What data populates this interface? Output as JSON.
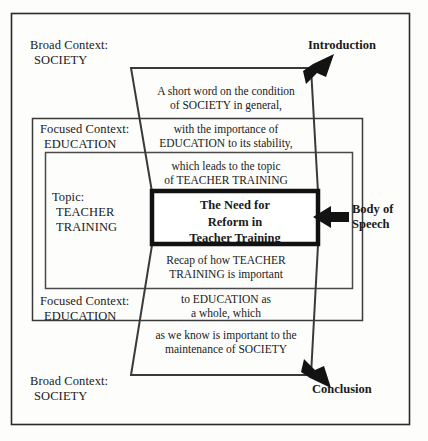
{
  "diagram": {
    "colors": {
      "ink": "#1a1a1a",
      "frame": "#222222",
      "paper": "#fdfdfc",
      "arrow_fill": "#111111"
    },
    "outer_frame": {
      "name": "outer-border"
    },
    "context_layers": [
      {
        "id": "broad-top",
        "line1": "Broad Context:",
        "line2": "SOCIETY"
      },
      {
        "id": "focused-top",
        "line1": "Focused Context:",
        "line2": "EDUCATION"
      },
      {
        "id": "topic",
        "line1": "Topic:",
        "line2": "TEACHER",
        "line3": "TRAINING"
      },
      {
        "id": "focused-bottom",
        "line1": "Focused Context:",
        "line2": "EDUCATION"
      },
      {
        "id": "broad-bottom",
        "line1": "Broad Context:",
        "line2": "SOCIETY"
      }
    ],
    "funnel_segments": [
      {
        "id": "segment-1",
        "line1": "A short word on the condition",
        "line2": "of SOCIETY in general,"
      },
      {
        "id": "segment-2",
        "line1": "with the importance of",
        "line2": "EDUCATION to its stability,"
      },
      {
        "id": "segment-3",
        "line1": "which leads to the topic",
        "line2": "of TEACHER TRAINING"
      },
      {
        "id": "segment-4",
        "line1": "Recap of how TEACHER",
        "line2": "TRAINING is important"
      },
      {
        "id": "segment-5",
        "line1": "to EDUCATION as",
        "line2": "a whole, which"
      },
      {
        "id": "segment-6",
        "line1": "as we know is important to the",
        "line2": "maintenance of SOCIETY"
      }
    ],
    "core_box": {
      "line1": "The Need for",
      "line2": "Reform in",
      "line3": "Teacher Training"
    },
    "callouts": [
      {
        "id": "introduction",
        "label": "Introduction",
        "icon": "arrow-down-left-icon"
      },
      {
        "id": "body-of-speech",
        "line1": "Body of",
        "line2": "Speech",
        "icon": "arrow-left-icon"
      },
      {
        "id": "conclusion",
        "label": "Conclusion",
        "icon": "arrow-up-left-icon"
      }
    ]
  }
}
